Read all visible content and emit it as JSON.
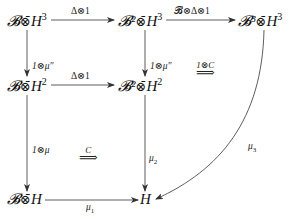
{
  "diagram": {
    "type": "commutative-diagram",
    "nodes": {
      "r1c1": {
        "base": "𝓑",
        "op": "⊗̄",
        "right": "H",
        "exp": "3"
      },
      "r1c2": {
        "base": "𝓑²",
        "op": "⊗̄",
        "right": "H",
        "exp": "3"
      },
      "r1c3": {
        "base": "𝓑³",
        "op": "⊗̄",
        "right": "H",
        "exp": "3"
      },
      "r2c1": {
        "base": "𝓑",
        "op": "⊗̄",
        "right": "H",
        "exp": "2"
      },
      "r2c2": {
        "base": "𝓑²",
        "op": "⊗̄",
        "right": "H",
        "exp": "2"
      },
      "r3c1": {
        "base": "𝓑",
        "op": "⊗̄",
        "right": "H",
        "exp": ""
      },
      "r3c2": {
        "base": "",
        "op": "",
        "right": "H",
        "exp": ""
      }
    },
    "edges": {
      "r1_12": "Δ⊗1",
      "r1_23": "𝓑⊗Δ⊗1",
      "r2_12": "Δ⊗1",
      "c1_12": "1⊗μ″",
      "c2_12": "1⊗μ″",
      "c1_23": "1⊗μ",
      "c2_23_main": "μ",
      "c2_23_sub": "2",
      "r3_12_main": "μ",
      "r3_12_sub": "1",
      "curve_main": "μ",
      "curve_sub": "3"
    },
    "natural_transformations": {
      "upper": {
        "label": "1⊗C",
        "symbol": "⟹"
      },
      "lower": {
        "label": "C",
        "symbol": "⟹"
      }
    }
  }
}
